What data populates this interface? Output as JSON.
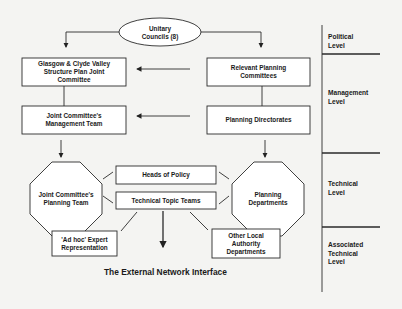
{
  "diagram": {
    "title": "The External Network Interface",
    "nodes": {
      "unitary": {
        "line1": "Unitary",
        "line2": "Councils (8)"
      },
      "glasgow": {
        "line1": "Glasgow & Clyde Valley",
        "line2": "Structure Plan Joint",
        "line3": "Committee"
      },
      "relevant": {
        "line1": "Relevant Planning",
        "line2": "Committees"
      },
      "joint_mgmt": {
        "line1": "Joint Committee's",
        "line2": "Management Team"
      },
      "directorates": {
        "line1": "Planning Directorates"
      },
      "joint_planning": {
        "line1": "Joint Committee's",
        "line2": "Planning Team"
      },
      "planning_depts": {
        "line1": "Planning",
        "line2": "Departments"
      },
      "heads_policy": {
        "line1": "Heads of Policy"
      },
      "topic_teams": {
        "line1": "Technical Topic Teams"
      },
      "adhoc": {
        "line1": "'Ad hoc' Expert",
        "line2": "Representation"
      },
      "other_local": {
        "line1": "Other Local",
        "line2": "Authority",
        "line3": "Departments"
      }
    },
    "levels": [
      {
        "line1": "Political",
        "line2": "Level"
      },
      {
        "line1": "Management",
        "line2": "Level"
      },
      {
        "line1": "Technical",
        "line2": "Level"
      },
      {
        "line1": "Associated",
        "line2": "Technical",
        "line3": "Level"
      }
    ],
    "colors": {
      "stroke": "#2a2a2a",
      "background": "#f4f4f2",
      "shape_fill": "#ffffff"
    }
  }
}
